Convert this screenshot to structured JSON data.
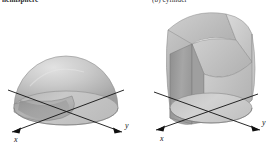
{
  "page": {
    "background_color": "#ffffff",
    "width": 280,
    "height": 146,
    "content_type": "textbook-figure-pair"
  },
  "captions": {
    "left": {
      "text": "hemisphere",
      "clipped": true,
      "note": "cut off at top edge of image"
    },
    "right": {
      "text": "(b)  cylinder",
      "clipped": true,
      "note": "cut off at top edge of image"
    }
  },
  "figures": [
    {
      "id": "hemisphere-with-notch",
      "name": "Hemisphere with cylindrical notch",
      "solid_type": "hemisphere",
      "shading": "grayscale-gradient",
      "axes": [
        {
          "name": "x",
          "label": "x",
          "direction": "lower-left"
        },
        {
          "name": "y",
          "label": "y",
          "direction": "lower-right"
        }
      ],
      "colors": {
        "dome_light": "#d8d8d8",
        "dome_mid": "#bdbdbd",
        "dome_dark": "#9a9a9a",
        "base_disc": "#c9c9c9",
        "cut_face": "#a8a8a8",
        "outline": "#8a8a8a",
        "axis": "#111111"
      }
    },
    {
      "id": "steinmetz-solid",
      "name": "Intersection of two cylinders (Steinmetz solid)",
      "solid_type": "bicylinder",
      "shading": "faceted-grayscale",
      "axes": [
        {
          "name": "x",
          "label": "x",
          "direction": "lower-left"
        },
        {
          "name": "y",
          "label": "y",
          "direction": "lower-right"
        }
      ],
      "colors": {
        "facet_light": "#d4d4d4",
        "facet_mid": "#b9b9b9",
        "facet_dark": "#9b9b9b",
        "facet_darkest": "#8a8a8a",
        "base_disc": "#cdcdcd",
        "outline": "#8a8a8a",
        "axis": "#111111"
      }
    }
  ],
  "axis_labels": {
    "x": "x",
    "y": "y"
  }
}
